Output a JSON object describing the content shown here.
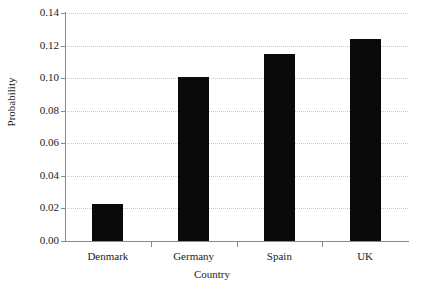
{
  "chart_data": {
    "type": "bar",
    "title": "",
    "subtitle": "",
    "categories": [
      "Denmark",
      "Germany",
      "Spain",
      "UK"
    ],
    "values": [
      0.023,
      0.101,
      0.115,
      0.124
    ],
    "xlabel": "Country",
    "ylabel": "Probability",
    "ylim": [
      0.0,
      0.14
    ],
    "ytick_values": [
      0.0,
      0.02,
      0.04,
      0.06,
      0.08,
      0.1,
      0.12,
      0.14
    ],
    "ytick_labels": [
      "0.00",
      "0.02",
      "0.04",
      "0.06",
      "0.08",
      "0.10",
      "0.12",
      "0.14"
    ],
    "grid": "horizontal-dotted",
    "legend": "none",
    "bar_color": "#0a0a0a",
    "grid_color": "#c9c9c9",
    "axis_color": "#8a8a8a",
    "background_color": "#ffffff",
    "annotations": []
  }
}
